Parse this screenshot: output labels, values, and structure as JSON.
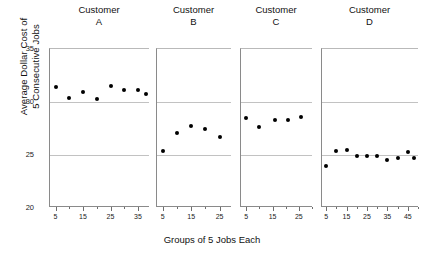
{
  "chart_data": {
    "type": "scatter",
    "title": "",
    "xlabel": "Groups of 5 Jobs Each",
    "ylabel": "Average Dollar Cost of 5 Consecutive Jobs",
    "ylabel_line1": "Average Dollar Cost of",
    "ylabel_line2": "5 Consecutive Jobs",
    "ylim": [
      20,
      35
    ],
    "yticks": [
      20,
      25,
      30,
      35
    ],
    "ytick_labels": [
      "20",
      "25",
      "30",
      "35"
    ],
    "gridlines": [
      25,
      30,
      35
    ],
    "grid": true,
    "legend": "none",
    "panels": [
      {
        "id": "A",
        "title_line1": "Customer",
        "title_line2": "A",
        "xlim": [
          3,
          39
        ],
        "xticks": [
          5,
          15,
          25,
          35
        ],
        "xtick_labels": [
          "5",
          "15",
          "25",
          "35"
        ],
        "x": [
          5,
          10,
          15,
          20,
          25,
          30,
          35,
          38
        ],
        "y": [
          31.4,
          30.4,
          30.9,
          30.3,
          31.5,
          31.1,
          31.1,
          30.8
        ]
      },
      {
        "id": "B",
        "title_line1": "Customer",
        "title_line2": "B",
        "xlim": [
          3,
          29
        ],
        "xticks": [
          5,
          15,
          25
        ],
        "xtick_labels": [
          "5",
          "15",
          "25"
        ],
        "x": [
          5,
          10,
          15,
          20,
          25
        ],
        "y": [
          25.4,
          27.1,
          27.7,
          27.5,
          26.7
        ]
      },
      {
        "id": "C",
        "title_line1": "Customer",
        "title_line2": "C",
        "xlim": [
          3,
          30
        ],
        "xticks": [
          5,
          15,
          25
        ],
        "xtick_labels": [
          "5",
          "15",
          "25"
        ],
        "x": [
          5,
          10,
          16,
          21,
          26
        ],
        "y": [
          28.5,
          27.6,
          28.3,
          28.3,
          28.6
        ]
      },
      {
        "id": "D",
        "title_line1": "Customer",
        "title_line2": "D",
        "xlim": [
          3,
          50
        ],
        "xticks": [
          5,
          15,
          25,
          35,
          45
        ],
        "xtick_labels": [
          "5",
          "15",
          "25",
          "35",
          "45"
        ],
        "x": [
          5,
          10,
          15,
          20,
          25,
          30,
          35,
          40,
          45,
          48
        ],
        "y": [
          24.0,
          25.4,
          25.5,
          24.9,
          24.9,
          24.9,
          24.5,
          24.7,
          25.3,
          24.7
        ]
      }
    ]
  },
  "colors": {
    "point": "#000000",
    "grid": "#c2c2c2",
    "axis": "#8a8a8a",
    "text": "#111111",
    "background": "#ffffff"
  }
}
